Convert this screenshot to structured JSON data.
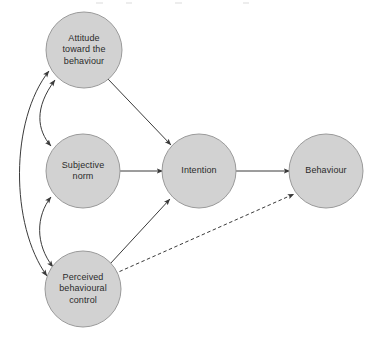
{
  "diagram": {
    "background_color": "#ffffff",
    "node_fill_color": "#d2d2d2",
    "node_stroke_color": "#9a9a9a",
    "edge_color": "#3a3a3a",
    "label_color": "#2b2b2b",
    "nodes": [
      {
        "id": "attitude",
        "label": "Attitude\ntoward the\nbehaviour",
        "cx": 84,
        "cy": 50,
        "r": 38
      },
      {
        "id": "subjective-norm",
        "label": "Subjective\nnorm",
        "cx": 83,
        "cy": 171,
        "r": 37
      },
      {
        "id": "perceived-behavioural-control",
        "label": "Perceived\nbehavioural\ncontrol",
        "cx": 83,
        "cy": 289,
        "r": 38
      },
      {
        "id": "intention",
        "label": "Intention",
        "cx": 199,
        "cy": 171,
        "r": 37
      },
      {
        "id": "behaviour",
        "label": "Behaviour",
        "cx": 326,
        "cy": 171,
        "r": 37
      }
    ],
    "edges": [
      {
        "id": "attitude-to-intention",
        "from": "attitude",
        "to": "intention",
        "style": "solid",
        "arrows": "single"
      },
      {
        "id": "subjective-norm-to-intention",
        "from": "subjective-norm",
        "to": "intention",
        "style": "solid",
        "arrows": "single"
      },
      {
        "id": "perceived-behavioural-control-to-intention",
        "from": "perceived-behavioural-control",
        "to": "intention",
        "style": "solid",
        "arrows": "single"
      },
      {
        "id": "intention-to-behaviour",
        "from": "intention",
        "to": "behaviour",
        "style": "solid",
        "arrows": "single"
      },
      {
        "id": "perceived-behavioural-control-to-behaviour",
        "from": "perceived-behavioural-control",
        "to": "behaviour",
        "style": "dashed",
        "arrows": "single"
      },
      {
        "id": "attitude-subjective-norm-correlation",
        "from": "attitude",
        "to": "subjective-norm",
        "style": "curved",
        "arrows": "double"
      },
      {
        "id": "subjective-norm-perceived-behavioural-control-correlation",
        "from": "subjective-norm",
        "to": "perceived-behavioural-control",
        "style": "curved",
        "arrows": "double"
      },
      {
        "id": "attitude-perceived-behavioural-control-correlation",
        "from": "attitude",
        "to": "perceived-behavioural-control",
        "style": "curved",
        "arrows": "double"
      }
    ]
  }
}
